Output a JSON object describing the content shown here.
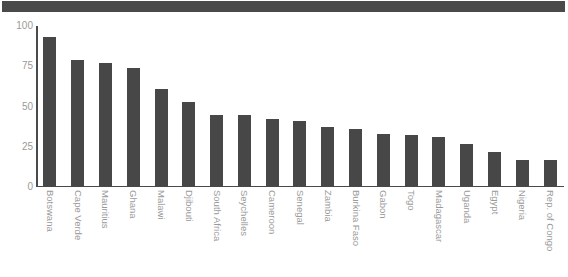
{
  "header": {
    "banner_color": "#4a4a4a"
  },
  "chart_data": {
    "type": "bar",
    "title": "",
    "subtitle": "",
    "xlabel": "",
    "ylabel": "",
    "ylim": [
      0,
      100
    ],
    "yticks": [
      0,
      25,
      50,
      75,
      100
    ],
    "ytick_labels": [
      "0",
      "25",
      "50",
      "75",
      "100"
    ],
    "grid": false,
    "legend": false,
    "legend_position": "none",
    "bar_color": "#474747",
    "axis_color": "#4a4a4a",
    "tick_label_color": "#9a9a9a",
    "categories": [
      "Botswana",
      "Cape Verde",
      "Mauritius",
      "Ghana",
      "Malawi",
      "Djibouti",
      "South Africa",
      "Seychelles",
      "Cameroon",
      "Senegal",
      "Zambia",
      "Burkina Faso",
      "Gabon",
      "Togo",
      "Madagascar",
      "Uganda",
      "Egypt",
      "Nigeria",
      "Rep. of Congo"
    ],
    "values": [
      93,
      79,
      77,
      74,
      61,
      53,
      45,
      45,
      42,
      41,
      37,
      36,
      33,
      32,
      31,
      27,
      22,
      17,
      17
    ]
  }
}
